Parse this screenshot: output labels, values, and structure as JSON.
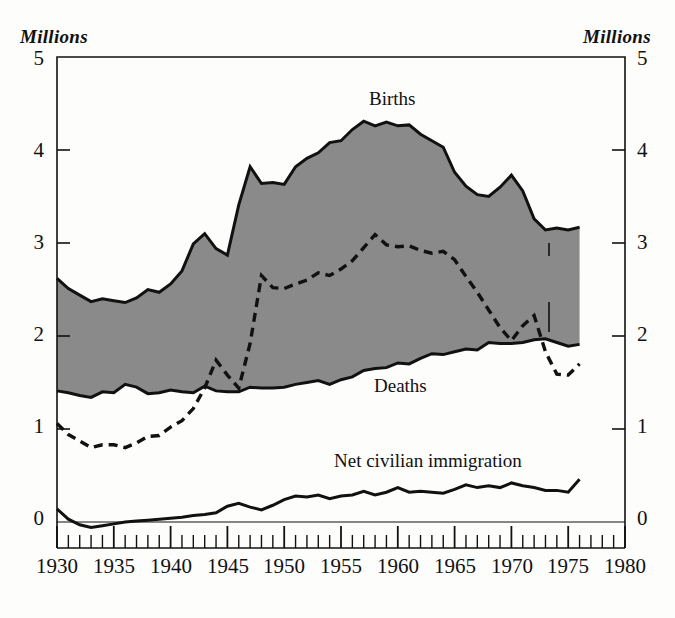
{
  "figure": {
    "unit_label_left": "Millions",
    "unit_label_right": "Millions",
    "background_color": "#fdfdfc",
    "ink_color": "#111111",
    "fill_color": "#8a8a8a"
  },
  "axes": {
    "y_ticks": [
      "0",
      "1",
      "2",
      "3",
      "4",
      "5"
    ],
    "y_left_labels": [
      "5",
      "4",
      "3",
      "2",
      "1",
      "0"
    ],
    "y_right_labels": [
      "5",
      "4",
      "3",
      "2",
      "1",
      "0"
    ],
    "ylim": [
      0,
      5
    ],
    "xlim": [
      1930,
      1980
    ],
    "x_tick_labels": [
      "1930",
      "1935",
      "1940",
      "1945",
      "1950",
      "1955",
      "1960",
      "1965",
      "1970",
      "1975",
      "1980"
    ],
    "x_minor_tick_interval": 1,
    "x_major_tick_interval": 5,
    "grid": false
  },
  "annotations": {
    "births": "Births",
    "net_growth": "Net growth",
    "deaths": "Deaths",
    "natural_increase_line1": "Natural",
    "natural_increase_line2": "increase",
    "net_civilian_immigration": "Net civilian immigration"
  },
  "chart_data": {
    "type": "area",
    "title": "",
    "subtitle": "",
    "xlabel": "",
    "ylabel": "Millions",
    "ylim": [
      0,
      5
    ],
    "xlim": [
      1930,
      1980
    ],
    "grid": false,
    "legend": "inline-annotations",
    "x": [
      1930,
      1931,
      1932,
      1933,
      1934,
      1935,
      1936,
      1937,
      1938,
      1939,
      1940,
      1941,
      1942,
      1943,
      1944,
      1945,
      1946,
      1947,
      1948,
      1949,
      1950,
      1951,
      1952,
      1953,
      1954,
      1955,
      1956,
      1957,
      1958,
      1959,
      1960,
      1961,
      1962,
      1963,
      1964,
      1965,
      1966,
      1967,
      1968,
      1969,
      1970,
      1971,
      1972,
      1973,
      1974,
      1975,
      1976
    ],
    "series": [
      {
        "name": "Births",
        "style": "solid-upper-boundary",
        "values": [
          2.62,
          2.51,
          2.44,
          2.37,
          2.4,
          2.38,
          2.36,
          2.41,
          2.5,
          2.47,
          2.56,
          2.7,
          2.99,
          3.1,
          2.94,
          2.87,
          3.41,
          3.82,
          3.64,
          3.65,
          3.63,
          3.82,
          3.91,
          3.97,
          4.08,
          4.1,
          4.22,
          4.31,
          4.26,
          4.3,
          4.26,
          4.27,
          4.17,
          4.1,
          4.03,
          3.76,
          3.61,
          3.52,
          3.5,
          3.6,
          3.73,
          3.56,
          3.26,
          3.14,
          3.16,
          3.14,
          3.17
        ]
      },
      {
        "name": "Deaths",
        "style": "solid-lower-boundary",
        "values": [
          1.41,
          1.39,
          1.36,
          1.34,
          1.4,
          1.39,
          1.48,
          1.45,
          1.38,
          1.39,
          1.42,
          1.4,
          1.39,
          1.46,
          1.41,
          1.4,
          1.4,
          1.45,
          1.44,
          1.44,
          1.45,
          1.48,
          1.5,
          1.52,
          1.48,
          1.53,
          1.56,
          1.63,
          1.65,
          1.66,
          1.71,
          1.7,
          1.76,
          1.81,
          1.8,
          1.83,
          1.86,
          1.85,
          1.93,
          1.92,
          1.92,
          1.93,
          1.96,
          1.97,
          1.93,
          1.89,
          1.91
        ]
      },
      {
        "name": "Net growth",
        "style": "dashed",
        "values": [
          1.06,
          0.94,
          0.87,
          0.8,
          0.83,
          0.83,
          0.8,
          0.85,
          0.92,
          0.93,
          1.02,
          1.09,
          1.22,
          1.44,
          1.74,
          1.58,
          1.44,
          1.92,
          2.65,
          2.52,
          2.51,
          2.56,
          2.6,
          2.68,
          2.65,
          2.72,
          2.81,
          2.95,
          3.09,
          2.98,
          2.96,
          2.97,
          2.92,
          2.89,
          2.91,
          2.82,
          2.64,
          2.47,
          2.28,
          2.09,
          1.95,
          2.11,
          2.22,
          1.83,
          1.59,
          1.58,
          1.7
        ]
      },
      {
        "name": "Net civilian immigration",
        "style": "solid",
        "values": [
          0.14,
          0.03,
          -0.03,
          -0.06,
          -0.04,
          -0.02,
          0.0,
          0.01,
          0.02,
          0.03,
          0.04,
          0.05,
          0.07,
          0.08,
          0.1,
          0.17,
          0.2,
          0.16,
          0.13,
          0.18,
          0.24,
          0.28,
          0.27,
          0.29,
          0.25,
          0.28,
          0.29,
          0.33,
          0.29,
          0.32,
          0.37,
          0.32,
          0.33,
          0.32,
          0.31,
          0.35,
          0.4,
          0.37,
          0.39,
          0.37,
          0.42,
          0.39,
          0.37,
          0.34,
          0.34,
          0.32,
          0.46
        ]
      }
    ]
  }
}
